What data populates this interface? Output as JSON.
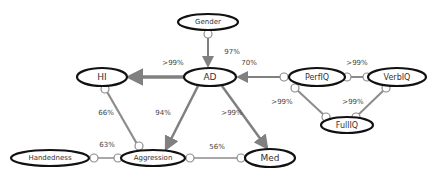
{
  "diagram": {
    "colors": {
      "node_stroke": "#111111",
      "edge_directed": "#808080",
      "edge_undirected": "#8c8c8c",
      "endpoint_fill": "#ffffff",
      "endpoint_stroke": "#8c8c8c",
      "text": "#333333"
    },
    "nodes": [
      {
        "id": "gender",
        "label": "Gender",
        "cx": 208,
        "cy": 22,
        "rx": 30,
        "ry": 8,
        "font_size": 7
      },
      {
        "id": "ad",
        "label": "AD",
        "cx": 210,
        "cy": 77,
        "rx": 26,
        "ry": 9,
        "font_size": 9
      },
      {
        "id": "hi",
        "label": "HI",
        "cx": 102,
        "cy": 77,
        "rx": 25,
        "ry": 9,
        "font_size": 9
      },
      {
        "id": "perfiq",
        "label": "PerfIQ",
        "cx": 317,
        "cy": 77,
        "rx": 28,
        "ry": 9,
        "font_size": 8
      },
      {
        "id": "verbiq",
        "label": "VerbIQ",
        "cx": 397,
        "cy": 77,
        "rx": 29,
        "ry": 9,
        "font_size": 8
      },
      {
        "id": "fulliq",
        "label": "FullIQ",
        "cx": 347,
        "cy": 125,
        "rx": 26,
        "ry": 8,
        "font_size": 8
      },
      {
        "id": "handedness",
        "label": "Handedness",
        "cx": 50,
        "cy": 158,
        "rx": 39,
        "ry": 8,
        "font_size": 7
      },
      {
        "id": "aggression",
        "label": "Aggression",
        "cx": 153,
        "cy": 158,
        "rx": 32,
        "ry": 8,
        "font_size": 7
      },
      {
        "id": "med",
        "label": "Med",
        "cx": 270,
        "cy": 158,
        "rx": 25,
        "ry": 9,
        "font_size": 9
      }
    ],
    "edges": [
      {
        "from": "gender",
        "to": "ad",
        "type": "circle-arrow",
        "label": "97%",
        "x1": 208,
        "y1": 35,
        "x2": 208,
        "y2": 66,
        "circle_x": 208,
        "circle_y": 34,
        "label_x": 232,
        "label_y": 52,
        "width": 2
      },
      {
        "from": "ad",
        "to": "hi",
        "type": "arrow",
        "label": ">99%",
        "x1": 184,
        "y1": 77,
        "x2": 129,
        "y2": 77,
        "label_x": 173,
        "label_y": 63,
        "width": 3.5
      },
      {
        "from": "perfiq",
        "to": "ad",
        "type": "circle-arrow",
        "label": "70%",
        "x1": 284,
        "y1": 77,
        "x2": 238,
        "y2": 77,
        "circle_x": 284,
        "circle_y": 77,
        "label_x": 249,
        "label_y": 63,
        "width": 2
      },
      {
        "from": "perfiq",
        "to": "verbiq",
        "type": "circle-circle",
        "label": ">99%",
        "x1": 351,
        "y1": 77,
        "x2": 363,
        "y2": 77,
        "circle_x1": 347,
        "circle_y1": 77,
        "circle_x2": 367,
        "circle_y2": 77,
        "label_x": 357,
        "label_y": 63,
        "width": 2
      },
      {
        "from": "perfiq",
        "to": "fulliq",
        "type": "circle-circle",
        "label": ">99%",
        "x1": 296,
        "y1": 89,
        "x2": 325,
        "y2": 116,
        "circle_x1": 295,
        "circle_y1": 88,
        "circle_x2": 326,
        "circle_y2": 117,
        "label_x": 282,
        "label_y": 102,
        "width": 2
      },
      {
        "from": "verbiq",
        "to": "fulliq",
        "type": "circle-circle",
        "label": ">99%",
        "x1": 385,
        "y1": 89,
        "x2": 357,
        "y2": 116,
        "circle_x1": 386,
        "circle_y1": 88,
        "circle_x2": 356,
        "circle_y2": 117,
        "label_x": 353,
        "label_y": 102,
        "width": 2
      },
      {
        "from": "hi",
        "to": "aggression",
        "type": "circle-circle",
        "label": "66%",
        "x1": 106,
        "y1": 90,
        "x2": 137,
        "y2": 144,
        "circle_x1": 105,
        "circle_y1": 89,
        "circle_x2": 139,
        "circle_y2": 146,
        "label_x": 106,
        "label_y": 113,
        "width": 2.2
      },
      {
        "from": "ad",
        "to": "aggression",
        "type": "arrow",
        "label": "94%",
        "x1": 198,
        "y1": 86,
        "x2": 166,
        "y2": 149,
        "label_x": 163,
        "label_y": 113,
        "width": 2.5
      },
      {
        "from": "ad",
        "to": "med",
        "type": "arrow",
        "label": ">99%",
        "x1": 222,
        "y1": 86,
        "x2": 267,
        "y2": 148,
        "label_x": 232,
        "label_y": 113,
        "width": 2.5
      },
      {
        "from": "handedness",
        "to": "aggression",
        "type": "circle-circle",
        "label": "63%",
        "x1": 93,
        "y1": 158,
        "x2": 114,
        "y2": 158,
        "circle_x1": 94,
        "circle_y1": 158,
        "circle_x2": 118,
        "circle_y2": 158,
        "label_x": 107,
        "label_y": 145,
        "width": 1.5
      },
      {
        "from": "aggression",
        "to": "med",
        "type": "circle-circle",
        "label": "56%",
        "x1": 193,
        "y1": 158,
        "x2": 237,
        "y2": 158,
        "circle_x1": 190,
        "circle_y1": 158,
        "circle_x2": 241,
        "circle_y2": 158,
        "label_x": 217,
        "label_y": 147,
        "width": 1.5
      }
    ]
  }
}
